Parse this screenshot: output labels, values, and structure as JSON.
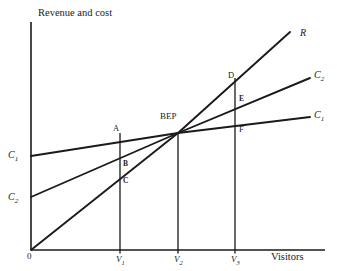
{
  "chart_data": {
    "type": "line",
    "title": "",
    "ylabel": "Revenue and cost",
    "xlabel": "Visitors",
    "grid": false,
    "legend_position": "right-inline",
    "origin_label": "0",
    "xticks": [
      {
        "label": "V",
        "sub": "1",
        "x": 120
      },
      {
        "label": "V",
        "sub": "2",
        "x": 178
      },
      {
        "label": "V",
        "sub": "3",
        "x": 235
      }
    ],
    "axis": {
      "x_start": 31,
      "x_end": 325,
      "y_top": 22,
      "y_base": 250
    },
    "series": [
      {
        "name": "R",
        "label": "R",
        "sub": "",
        "description": "Revenue line through origin",
        "points": [
          [
            31,
            250
          ],
          [
            178,
            133
          ],
          [
            290,
            32
          ]
        ],
        "left_label": "",
        "right_label": "R",
        "right_label_x": 300,
        "right_label_y": 28
      },
      {
        "name": "C2",
        "label": "C",
        "sub": "2",
        "description": "Cost line 2: lower fixed cost, higher variable cost",
        "points": [
          [
            31,
            197
          ],
          [
            178,
            133
          ],
          [
            310,
            78
          ]
        ],
        "left_label": "C",
        "left_sub": "2",
        "left_label_x": 8,
        "left_label_y": 192,
        "right_label": "C",
        "right_sub": "2",
        "right_label_x": 314,
        "right_label_y": 70
      },
      {
        "name": "C1",
        "label": "C",
        "sub": "1",
        "description": "Cost line 1: higher fixed cost, lower variable cost",
        "points": [
          [
            31,
            156
          ],
          [
            178,
            133
          ],
          [
            310,
            117
          ]
        ],
        "left_label": "C",
        "left_sub": "1",
        "left_label_x": 8,
        "left_label_y": 150,
        "right_label": "C",
        "right_sub": "1",
        "right_label_x": 314,
        "right_label_y": 110
      }
    ],
    "verticals": [
      {
        "name": "V1-line",
        "x": 120,
        "y_top": 133,
        "y_bottom": 250
      },
      {
        "name": "V2-line",
        "x": 178,
        "y_top": 133,
        "y_bottom": 250
      },
      {
        "name": "V3-line",
        "x": 235,
        "y_top": 78,
        "y_bottom": 250
      }
    ],
    "annotations": [
      {
        "name": "A",
        "text": "A",
        "x": 113,
        "y": 124,
        "style": "plain"
      },
      {
        "name": "B",
        "text": "B",
        "x": 123,
        "y": 160,
        "style": "bold"
      },
      {
        "name": "C",
        "text": "C",
        "x": 123,
        "y": 177,
        "style": "bold"
      },
      {
        "name": "BEP",
        "text": "BEP",
        "x": 160,
        "y": 112,
        "style": "plain"
      },
      {
        "name": "D",
        "text": "D",
        "x": 228,
        "y": 71,
        "style": "plain"
      },
      {
        "name": "E",
        "text": "E",
        "x": 239,
        "y": 95,
        "style": "bold"
      },
      {
        "name": "F",
        "text": "F",
        "x": 239,
        "y": 125,
        "style": "plain"
      }
    ]
  },
  "colors": {
    "line": "#1a1a1a",
    "axis": "#1a1a1a",
    "background": "#ffffff",
    "text": "#1a1a1a"
  }
}
